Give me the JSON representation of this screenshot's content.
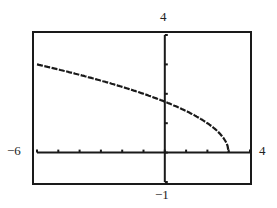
{
  "chart_data": {
    "type": "line",
    "title": "",
    "xlabel": "",
    "ylabel": "",
    "window": {
      "xmin": -6,
      "xmax": 4,
      "ymin": -1,
      "ymax": 4,
      "xscl": 1,
      "yscl": 1
    },
    "xlim": [
      -6,
      4
    ],
    "ylim": [
      -1,
      4
    ],
    "tick_labels": {
      "xmin": "−6",
      "xmax": "4",
      "ymin": "−1",
      "ymax": "4"
    },
    "grid": false,
    "series": [
      {
        "name": "y = sqrt(3 - x)",
        "x": [
          -6,
          -5,
          -4,
          -3,
          -2,
          -1,
          0,
          1,
          2,
          2.5,
          2.75,
          3
        ],
        "y": [
          3.0,
          2.83,
          2.65,
          2.45,
          2.24,
          2.0,
          1.73,
          1.41,
          1.0,
          0.71,
          0.5,
          0.0
        ]
      }
    ]
  }
}
